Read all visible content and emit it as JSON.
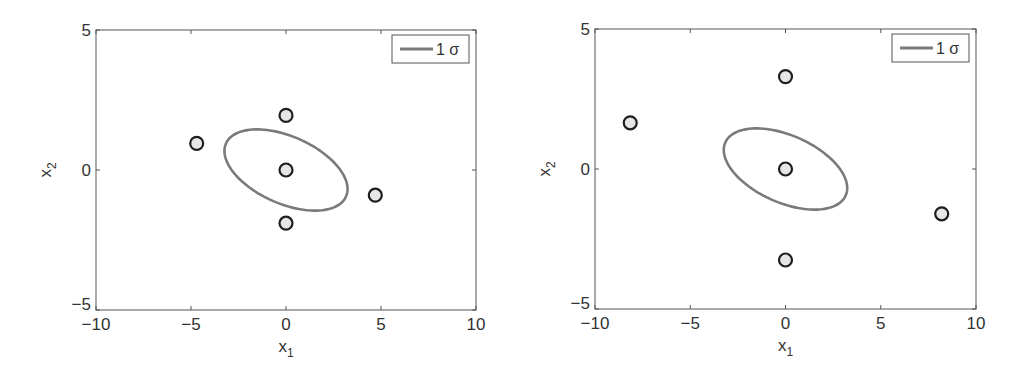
{
  "chart_data": [
    {
      "type": "scatter",
      "title": "",
      "xlabel": "x_1",
      "ylabel": "x_2",
      "xlim": [
        -10,
        10
      ],
      "ylim": [
        -5,
        5
      ],
      "xticks": [
        -10,
        -5,
        0,
        5,
        10
      ],
      "yticks": [
        -5,
        0,
        5
      ],
      "xtick_labels": [
        "−10",
        "−5",
        "0",
        "5",
        "10"
      ],
      "ytick_labels": [
        "−5",
        "0",
        "5"
      ],
      "grid": false,
      "legend": {
        "position": "upper right",
        "entries": [
          "1 σ"
        ]
      },
      "series": [
        {
          "name": "sigma points",
          "marker": "circle",
          "points": [
            [
              -4.7,
              0.95
            ],
            [
              0,
              1.95
            ],
            [
              0,
              0
            ],
            [
              0,
              -1.9
            ],
            [
              4.7,
              -0.9
            ]
          ]
        },
        {
          "name": "1 σ",
          "kind": "ellipse",
          "center": [
            0,
            0
          ],
          "sigma_x": 3.24,
          "sigma_y": 1.45,
          "rho": -0.47
        }
      ]
    },
    {
      "type": "scatter",
      "title": "",
      "xlabel": "x_1",
      "ylabel": "x_2",
      "xlim": [
        -10,
        10
      ],
      "ylim": [
        -5,
        5
      ],
      "xticks": [
        -10,
        -5,
        0,
        5,
        10
      ],
      "yticks": [
        -5,
        0,
        5
      ],
      "xtick_labels": [
        "−10",
        "−5",
        "0",
        "5",
        "10"
      ],
      "ytick_labels": [
        "−5",
        "0",
        "5"
      ],
      "grid": false,
      "legend": {
        "position": "upper right",
        "entries": [
          "1 σ"
        ]
      },
      "series": [
        {
          "name": "sigma points",
          "marker": "circle",
          "points": [
            [
              -8.15,
              1.65
            ],
            [
              0,
              3.3
            ],
            [
              0,
              0
            ],
            [
              0,
              -3.25
            ],
            [
              8.2,
              -1.6
            ]
          ]
        },
        {
          "name": "1 σ",
          "kind": "ellipse",
          "center": [
            0,
            0
          ],
          "sigma_x": 3.24,
          "sigma_y": 1.45,
          "rho": -0.47
        }
      ]
    }
  ],
  "panels": [
    {
      "legend_label": "1 σ",
      "xlabel": "x",
      "xlabel_sub": "1",
      "ylabel": "x",
      "ylabel_sub": "2"
    },
    {
      "legend_label": "1 σ",
      "xlabel": "x",
      "xlabel_sub": "1",
      "ylabel": "x",
      "ylabel_sub": "2"
    }
  ],
  "colors": {
    "axis": "#555555",
    "ellipse": "#7a7a7a",
    "marker_edge": "#1e1e1e",
    "marker_fill": "#e6e6e6",
    "legend_border": "#555555"
  }
}
